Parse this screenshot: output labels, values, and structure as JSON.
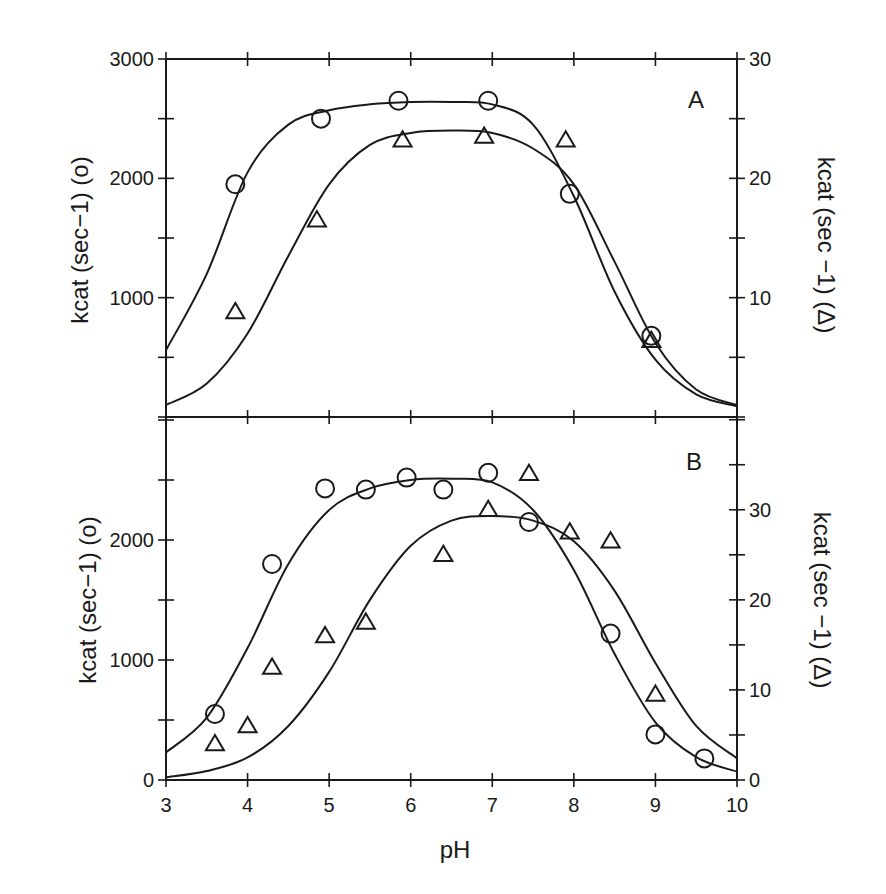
{
  "figure": {
    "xlabel": "pH",
    "x_ticks": [
      "3",
      "4",
      "5",
      "6",
      "7",
      "8",
      "9",
      "10"
    ],
    "ink_color": "#1a1a1a",
    "background": "#ffffff"
  },
  "chart_data": [
    {
      "panel": "A",
      "type": "scatter",
      "title": "A",
      "xlabel": "pH",
      "ylabel_left": "kcat (sec−1) (o)",
      "ylabel_right": "kcat (sec −1) (Δ)",
      "xlim": [
        3,
        10
      ],
      "ylim_left": [
        0,
        3000
      ],
      "ylim_right": [
        0,
        30
      ],
      "left_ticks": [
        "1000",
        "2000",
        "3000"
      ],
      "right_ticks": [
        "10",
        "20",
        "30"
      ],
      "grid": false,
      "series": [
        {
          "name": "circles (left axis)",
          "marker": "circle",
          "axis": "left",
          "x": [
            3.85,
            4.9,
            5.85,
            6.95,
            7.95,
            8.95
          ],
          "y": [
            1950,
            2500,
            2650,
            2650,
            1870,
            680
          ],
          "fit_curve": {
            "x": [
              3.0,
              3.5,
              4.0,
              4.5,
              5.0,
              5.5,
              6.0,
              6.5,
              7.0,
              7.5,
              8.0,
              8.5,
              9.0,
              9.5,
              10.0
            ],
            "y": [
              560,
              1200,
              2050,
              2450,
              2570,
              2620,
              2640,
              2640,
              2620,
              2450,
              1850,
              1050,
              480,
              190,
              90
            ]
          }
        },
        {
          "name": "triangles (right axis)",
          "marker": "triangle",
          "axis": "right",
          "x": [
            3.85,
            4.85,
            5.9,
            6.9,
            7.9,
            8.95
          ],
          "y": [
            8.8,
            16.5,
            23.2,
            23.5,
            23.2,
            6.4
          ],
          "fit_curve": {
            "x": [
              3.0,
              3.5,
              4.0,
              4.5,
              5.0,
              5.5,
              6.0,
              6.5,
              7.0,
              7.5,
              8.0,
              8.5,
              9.0,
              9.5,
              10.0
            ],
            "y": [
              1.0,
              2.8,
              7.0,
              13.5,
              19.5,
              22.8,
              23.8,
              24.0,
              23.8,
              22.5,
              19.5,
              13.0,
              6.2,
              2.3,
              1.0
            ]
          }
        }
      ]
    },
    {
      "panel": "B",
      "type": "scatter",
      "title": "B",
      "xlabel": "pH",
      "ylabel_left": "kcat (sec−1) (o)",
      "ylabel_right": "kcat (sec −1) (Δ)",
      "xlim": [
        3,
        10
      ],
      "ylim_left": [
        0,
        2800
      ],
      "ylim_right": [
        0,
        37.3
      ],
      "left_ticks": [
        "0",
        "1000",
        "2000"
      ],
      "right_ticks": [
        "0",
        "10",
        "20",
        "30"
      ],
      "grid": false,
      "series": [
        {
          "name": "circles (left axis)",
          "marker": "circle",
          "axis": "left",
          "x": [
            3.6,
            4.3,
            4.95,
            5.45,
            5.95,
            6.4,
            6.95,
            7.45,
            8.45,
            9.0,
            9.6
          ],
          "y": [
            550,
            1800,
            2430,
            2420,
            2520,
            2420,
            2560,
            2150,
            1220,
            380,
            180
          ],
          "fit_curve": {
            "x": [
              3.0,
              3.5,
              4.0,
              4.5,
              5.0,
              5.5,
              6.0,
              6.5,
              7.0,
              7.5,
              8.0,
              8.5,
              9.0,
              9.5,
              10.0
            ],
            "y": [
              230,
              520,
              1100,
              1800,
              2250,
              2430,
              2500,
              2510,
              2480,
              2250,
              1750,
              1050,
              480,
              190,
              70
            ]
          }
        },
        {
          "name": "triangles (right axis)",
          "marker": "triangle",
          "axis": "right",
          "x": [
            3.6,
            4.0,
            4.3,
            4.95,
            5.45,
            6.4,
            6.95,
            7.45,
            7.95,
            8.45,
            9.0
          ],
          "y": [
            4.0,
            6.0,
            12.5,
            16.0,
            17.5,
            25.0,
            30.0,
            34.0,
            27.5,
            26.5,
            9.5
          ],
          "fit_curve": {
            "x": [
              3.0,
              3.5,
              4.0,
              4.5,
              5.0,
              5.5,
              6.0,
              6.5,
              7.0,
              7.5,
              8.0,
              8.5,
              9.0,
              9.5,
              10.0
            ],
            "y": [
              0.3,
              1.0,
              2.5,
              6.0,
              12.0,
              20.0,
              26.0,
              28.8,
              29.3,
              28.8,
              26.5,
              21.0,
              13.0,
              6.0,
              2.4
            ]
          }
        }
      ]
    }
  ]
}
